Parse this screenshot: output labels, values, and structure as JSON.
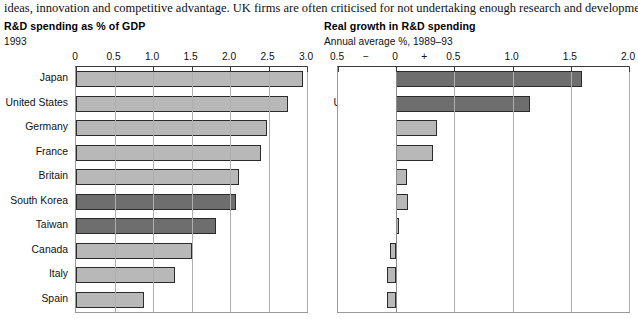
{
  "lede": "ideas, innovation and competitive advantage. UK firms are often criticised for not undertaking enough research and development.",
  "panels": {
    "left": {
      "title": "R&D spending as % of GDP",
      "subtitle": "1993"
    },
    "right": {
      "title": "Real growth in R&D spending",
      "subtitle": "Annual average %, 1989–93"
    }
  },
  "colors": {
    "bar_light": "#b8b8b8",
    "bar_dark": "#6e6e6e",
    "bar_edge": "#2b2b2b",
    "grid": "#aeaeae",
    "frame": "#9a9a9a",
    "text": "#111111",
    "background": "#ffffff"
  },
  "chart_data": [
    {
      "type": "bar",
      "orientation": "horizontal",
      "title": "R&D spending as % of GDP",
      "subtitle": "1993",
      "xlabel": "",
      "ylabel": "",
      "xlim": [
        0,
        3.0
      ],
      "grid": true,
      "legend": "none",
      "tick_labels": [
        "0",
        "0.5",
        "1.0",
        "1.5",
        "2.0",
        "2.5",
        "3.0"
      ],
      "tick_values": [
        0,
        0.5,
        1.0,
        1.5,
        2.0,
        2.5,
        3.0
      ],
      "categories": [
        "Japan",
        "United States",
        "Germany",
        "France",
        "Britain",
        "South Korea",
        "Taiwan",
        "Canada",
        "Italy",
        "Spain"
      ],
      "values": [
        2.95,
        2.75,
        2.48,
        2.4,
        2.12,
        2.08,
        1.82,
        1.5,
        1.28,
        0.88
      ],
      "highlight": [
        "South Korea",
        "Taiwan"
      ]
    },
    {
      "type": "bar",
      "orientation": "horizontal",
      "title": "Real growth in R&D spending",
      "subtitle": "Annual average %, 1989–93",
      "xlabel": "",
      "ylabel": "",
      "xlim": [
        -0.5,
        2.0
      ],
      "grid": true,
      "legend": "none",
      "tick_labels": [
        "0.5",
        "−",
        "0",
        "+",
        "0.5",
        "1.0",
        "1.5",
        "2.0"
      ],
      "tick_values": [
        -0.5,
        -0.25,
        0,
        0.25,
        0.5,
        1.0,
        1.5,
        2.0
      ],
      "gridline_values": [
        -0.5,
        0,
        0.5,
        1.0,
        1.5,
        2.0
      ],
      "categories": [
        "Japan",
        "United States",
        "Germany",
        "France",
        "Britain",
        "South Korea",
        "Taiwan",
        "Canada",
        "Italy",
        "Spain"
      ],
      "values": [
        1.6,
        1.15,
        0.35,
        0.32,
        0.09,
        0.1,
        0.02,
        -0.05,
        -0.08,
        -0.08
      ],
      "highlight": [
        "Japan",
        "United States"
      ]
    }
  ]
}
